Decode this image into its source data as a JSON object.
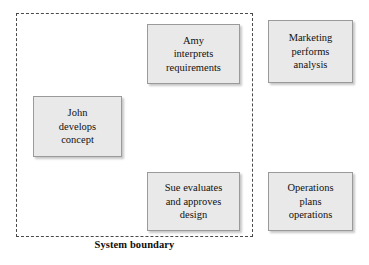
{
  "diagram": {
    "boundary": {
      "label": "System boundary",
      "style": "dashed",
      "color": "#4a4a4a"
    },
    "box_style": {
      "fill": "#e9e9e9",
      "border": "#9a9a9a",
      "text": "#111111"
    },
    "boxes": [
      {
        "id": "amy",
        "label": "Amy\ninterprets\nrequirements",
        "inside_boundary": true
      },
      {
        "id": "marketing",
        "label": "Marketing\nperforms\nanalysis",
        "inside_boundary": false
      },
      {
        "id": "john",
        "label": "John\ndevelops\nconcept",
        "inside_boundary": true
      },
      {
        "id": "sue",
        "label": "Sue evaluates\nand approves\ndesign",
        "inside_boundary": true
      },
      {
        "id": "operations",
        "label": "Operations\nplans\noperations",
        "inside_boundary": false
      }
    ]
  }
}
